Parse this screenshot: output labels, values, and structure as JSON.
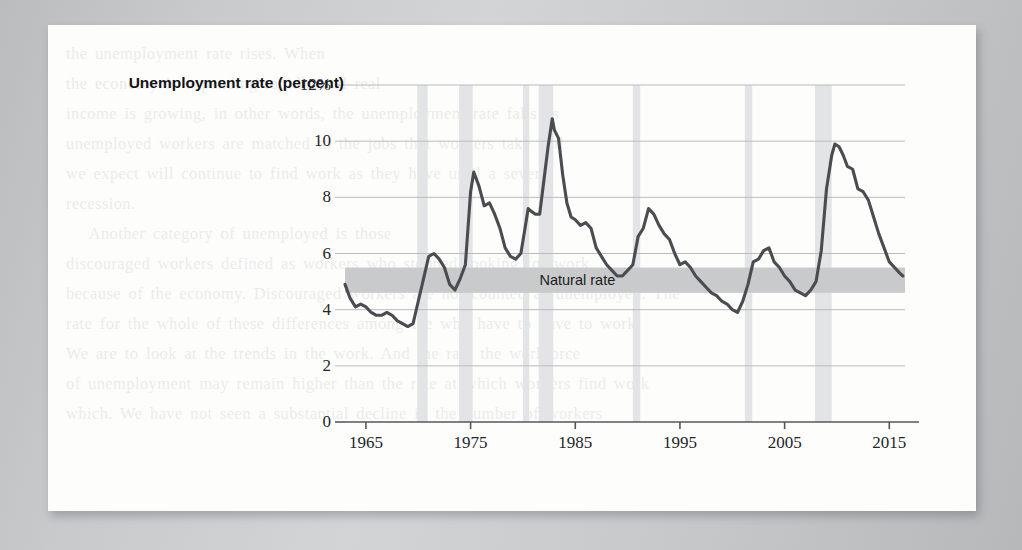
{
  "page": {
    "background_color": "#c9cbcd",
    "sheet_color": "#fdfdfc",
    "showthrough_text": "the unemployment rate rises. When\nthe economy is expanding rapidly and real\nincome is growing, in other words, the unemployment rate falls as\nunemployed workers are matched to the jobs that workers take and\nwe expect will continue to find work as they have until a severe\nrecession.\n   Another category of unemployed is those\ndiscouraged workers defined as workers who stopped looking for work\nbecause of the economy. Discouraged workers are not counted as unemployed. The\nrate for the whole of these differences among the who have to have to work\nWe are to look at the trends in the work. And the rate the workforce\nof unemployment may remain higher than the rate at which workers find work\nwhich. We have not seen a substantial decline in the number of workers"
  },
  "chart_data": {
    "type": "line",
    "title": "",
    "ylabel": "Unemployment rate (percent)",
    "xlabel": "",
    "ylim": [
      0,
      12
    ],
    "xlim": [
      1963.0,
      2016.5
    ],
    "grid": true,
    "legend": "none",
    "y_ticks": [
      0,
      2,
      4,
      6,
      8,
      10,
      12
    ],
    "y_tick_labels": [
      "0",
      "2",
      "4",
      "6",
      "8",
      "10",
      "12%"
    ],
    "x_ticks": [
      1965,
      1975,
      1985,
      1995,
      2005,
      2015
    ],
    "x_tick_labels": [
      "1965",
      "1975",
      "1985",
      "1995",
      "2005",
      "2015"
    ],
    "series_color": "#4a4c50",
    "grid_color": "#b9bbbe",
    "axis_color": "#55575b",
    "natural_rate_band": {
      "label": "Natural rate",
      "label_x": 1985.2,
      "y_low": 4.6,
      "y_high": 5.5,
      "color": "#c9cacb"
    },
    "recession_bands": {
      "color": "#e3e4e5",
      "spans": [
        [
          1969.9,
          1970.9
        ],
        [
          1973.9,
          1975.2
        ],
        [
          1980.0,
          1980.6
        ],
        [
          1981.5,
          1982.9
        ],
        [
          1990.5,
          1991.2
        ],
        [
          2001.2,
          2001.9
        ],
        [
          2007.9,
          2009.5
        ]
      ]
    },
    "series": [
      {
        "name": "Unemployment rate",
        "x": [
          1963.0,
          1963.5,
          1964.0,
          1964.5,
          1965.0,
          1965.5,
          1966.0,
          1966.5,
          1967.0,
          1967.5,
          1968.0,
          1968.5,
          1969.0,
          1969.5,
          1970.0,
          1970.5,
          1971.0,
          1971.5,
          1972.0,
          1972.5,
          1973.0,
          1973.5,
          1974.0,
          1974.5,
          1975.0,
          1975.3,
          1975.8,
          1976.3,
          1976.8,
          1977.3,
          1977.8,
          1978.3,
          1978.8,
          1979.3,
          1979.8,
          1980.2,
          1980.5,
          1980.8,
          1981.2,
          1981.6,
          1982.0,
          1982.4,
          1982.8,
          1983.0,
          1983.4,
          1983.8,
          1984.2,
          1984.6,
          1985.0,
          1985.5,
          1986.0,
          1986.5,
          1987.0,
          1987.5,
          1988.0,
          1988.5,
          1989.0,
          1989.5,
          1990.0,
          1990.5,
          1991.0,
          1991.5,
          1992.0,
          1992.5,
          1993.0,
          1993.5,
          1994.0,
          1994.5,
          1995.0,
          1995.5,
          1996.0,
          1996.5,
          1997.0,
          1997.5,
          1998.0,
          1998.5,
          1999.0,
          1999.5,
          2000.0,
          2000.5,
          2001.0,
          2001.5,
          2002.0,
          2002.5,
          2003.0,
          2003.5,
          2004.0,
          2004.5,
          2005.0,
          2005.5,
          2006.0,
          2006.5,
          2007.0,
          2007.5,
          2008.0,
          2008.5,
          2009.0,
          2009.5,
          2009.8,
          2010.2,
          2010.6,
          2011.0,
          2011.5,
          2012.0,
          2012.5,
          2013.0,
          2013.5,
          2014.0,
          2014.5,
          2015.0,
          2015.5,
          2016.0,
          2016.3
        ],
        "values": [
          4.9,
          4.4,
          4.1,
          4.2,
          4.1,
          3.9,
          3.8,
          3.8,
          3.9,
          3.8,
          3.6,
          3.5,
          3.4,
          3.5,
          4.3,
          5.1,
          5.9,
          6.0,
          5.8,
          5.5,
          4.9,
          4.7,
          5.1,
          5.6,
          8.2,
          8.9,
          8.4,
          7.7,
          7.8,
          7.4,
          6.9,
          6.2,
          5.9,
          5.8,
          6.0,
          6.9,
          7.6,
          7.5,
          7.4,
          7.4,
          8.6,
          9.8,
          10.8,
          10.4,
          10.1,
          8.8,
          7.8,
          7.3,
          7.2,
          7.0,
          7.1,
          6.9,
          6.2,
          5.9,
          5.6,
          5.4,
          5.2,
          5.2,
          5.4,
          5.6,
          6.6,
          6.9,
          7.6,
          7.4,
          7.0,
          6.7,
          6.5,
          6.0,
          5.6,
          5.7,
          5.5,
          5.2,
          5.0,
          4.8,
          4.6,
          4.5,
          4.3,
          4.2,
          4.0,
          3.9,
          4.3,
          4.9,
          5.7,
          5.8,
          6.1,
          6.2,
          5.7,
          5.5,
          5.2,
          5.0,
          4.7,
          4.6,
          4.5,
          4.7,
          5.0,
          6.1,
          8.3,
          9.5,
          9.9,
          9.8,
          9.5,
          9.1,
          9.0,
          8.3,
          8.2,
          7.9,
          7.3,
          6.7,
          6.2,
          5.7,
          5.5,
          5.3,
          5.2
        ]
      }
    ]
  }
}
